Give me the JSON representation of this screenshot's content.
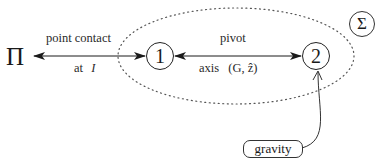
{
  "diagram": {
    "plane": {
      "symbol": "Π"
    },
    "system": {
      "symbol": "Σ"
    },
    "nodes": [
      {
        "id": "1",
        "label": "1"
      },
      {
        "id": "2",
        "label": "2"
      }
    ],
    "edges": [
      {
        "from": "Π",
        "to": "1",
        "label_top": "point contact",
        "label_bottom": "at",
        "label_bottom_var": "I"
      },
      {
        "from": "1",
        "to": "2",
        "label_top": "pivot",
        "label_bottom": "axis",
        "label_bottom_expr": "(G, ẑ)"
      }
    ],
    "external": {
      "label": "gravity",
      "target": "2"
    },
    "colors": {
      "stroke": "#1a1a1a",
      "dotted": "#555555"
    }
  }
}
